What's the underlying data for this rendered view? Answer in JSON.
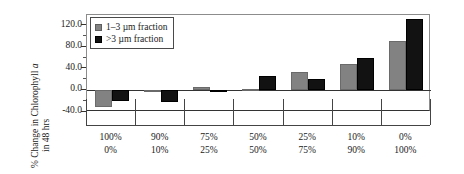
{
  "chart_data": {
    "type": "bar",
    "title": "",
    "subtitle": "",
    "xlabel": "",
    "ylabel": "% Change in Chlorophyll a in 48 hrs",
    "ylabel_line1": "% Change in Chlorophyll ",
    "ylabel_line1_italic": "a",
    "ylabel_line2": "in 48 hrs",
    "ylim": [
      -40.0,
      140.0
    ],
    "yticks": [
      "-40.0",
      "0.0",
      "40.0",
      "80.0",
      "120.0"
    ],
    "ytick_values": [
      -40.0,
      0.0,
      40.0,
      80.0,
      120.0
    ],
    "grid": false,
    "legend_position": "upper-left",
    "categories": [
      "100%\n0%",
      "90%\n10%",
      "75%\n25%",
      "50%\n50%",
      "25%\n75%",
      "10%\n90%",
      "0%\n100%"
    ],
    "category_labels": [
      {
        "top": "100%",
        "bottom": "0%"
      },
      {
        "top": "90%",
        "bottom": "10%"
      },
      {
        "top": "75%",
        "bottom": "25%"
      },
      {
        "top": "50%",
        "bottom": "50%"
      },
      {
        "top": "25%",
        "bottom": "75%"
      },
      {
        "top": "10%",
        "bottom": "90%"
      },
      {
        "top": "0%",
        "bottom": "100%"
      }
    ],
    "series": [
      {
        "name": "1–3 µm fraction",
        "color": "#828282",
        "values": [
          -30.0,
          -2.0,
          7.0,
          3.0,
          35.0,
          50.0,
          92.0
        ]
      },
      {
        "name": ">3 µm fraction",
        "color": "#121212",
        "values": [
          -20.0,
          -22.0,
          -3.0,
          27.0,
          21.0,
          61.0,
          133.0
        ]
      }
    ]
  },
  "legend": {
    "items": [
      {
        "label": "1–3 µm fraction",
        "color": "#828282"
      },
      {
        "label": ">3 µm fraction",
        "color": "#121212"
      }
    ]
  },
  "colors": {
    "series_1_3um": "#828282",
    "series_gt3um": "#121212",
    "axis": "#333333",
    "frame": "#8c8c8c",
    "background": "#ffffff"
  }
}
